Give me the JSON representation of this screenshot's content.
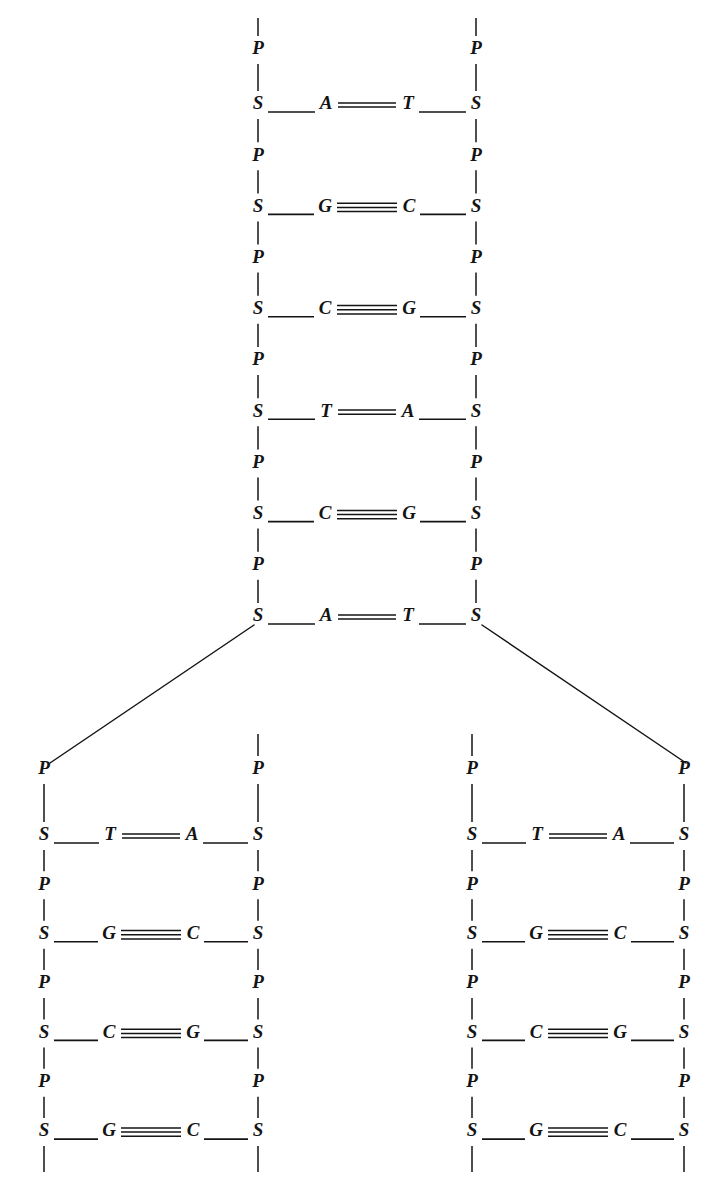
{
  "figure": {
    "background_color": "#ffffff",
    "ink_color": "#141414",
    "width": 727,
    "height": 1194
  },
  "legend_symbols": {
    "phosphate": "P",
    "sugar": "S",
    "adenine": "A",
    "thymine": "T",
    "guanine": "G",
    "cytosine": "C"
  },
  "bond_counts": {
    "A-T": 2,
    "T-A": 2,
    "G-C": 3,
    "C-G": 3
  },
  "parent_duplex": {
    "name": "parent-dna-molecule",
    "left_backbone_x": 258,
    "right_backbone_x": 476,
    "top_phosphate_y": 50,
    "rung_start_y": 105,
    "rung_spacing": 102.4,
    "rungs": [
      {
        "index": 1,
        "left_base": "A",
        "right_base": "T",
        "bonds": 2,
        "left_sugar": "S",
        "right_sugar": "S"
      },
      {
        "index": 2,
        "left_base": "G",
        "right_base": "C",
        "bonds": 3,
        "left_sugar": "S",
        "right_sugar": "S"
      },
      {
        "index": 3,
        "left_base": "C",
        "right_base": "G",
        "bonds": 3,
        "left_sugar": "S",
        "right_sugar": "S"
      },
      {
        "index": 4,
        "left_base": "T",
        "right_base": "A",
        "bonds": 2,
        "left_sugar": "S",
        "right_sugar": "S"
      },
      {
        "index": 5,
        "left_base": "C",
        "right_base": "G",
        "bonds": 3,
        "left_sugar": "S",
        "right_sugar": "S"
      },
      {
        "index": 6,
        "left_base": "A",
        "right_base": "T",
        "bonds": 2,
        "left_sugar": "S",
        "right_sugar": "S"
      }
    ],
    "interleaved_phosphates": [
      "P",
      "P",
      "P",
      "P",
      "P",
      "P",
      "P"
    ]
  },
  "replication_fork": {
    "name": "replication-fork",
    "left_branch": {
      "from_x": 254,
      "from_y": 625,
      "to_x": 50,
      "to_y": 763
    },
    "right_branch": {
      "from_x": 482,
      "from_y": 625,
      "to_x": 686,
      "to_y": 763
    }
  },
  "daughter_duplexes": [
    {
      "name": "left-daughter-dna-molecule",
      "left_backbone_x": 44,
      "right_backbone_x": 258,
      "top_phosphate_y": 770,
      "rung_start_y": 836,
      "rung_spacing": 98.7,
      "outer_strand": "left",
      "rungs": [
        {
          "index": 1,
          "left_base": "T",
          "right_base": "A",
          "bonds": 2,
          "left_sugar": "S",
          "right_sugar": "S"
        },
        {
          "index": 2,
          "left_base": "G",
          "right_base": "C",
          "bonds": 3,
          "left_sugar": "S",
          "right_sugar": "S"
        },
        {
          "index": 3,
          "left_base": "C",
          "right_base": "G",
          "bonds": 3,
          "left_sugar": "S",
          "right_sugar": "S"
        },
        {
          "index": 4,
          "left_base": "G",
          "right_base": "C",
          "bonds": 3,
          "left_sugar": "S",
          "right_sugar": "S"
        }
      ],
      "interleaved_phosphates": [
        "P",
        "P",
        "P",
        "P"
      ]
    },
    {
      "name": "right-daughter-dna-molecule",
      "left_backbone_x": 472,
      "right_backbone_x": 684,
      "top_phosphate_y": 770,
      "rung_start_y": 836,
      "rung_spacing": 98.7,
      "outer_strand": "right",
      "rungs": [
        {
          "index": 1,
          "left_base": "T",
          "right_base": "A",
          "bonds": 2,
          "left_sugar": "S",
          "right_sugar": "S"
        },
        {
          "index": 2,
          "left_base": "G",
          "right_base": "C",
          "bonds": 3,
          "left_sugar": "S",
          "right_sugar": "S"
        },
        {
          "index": 3,
          "left_base": "C",
          "right_base": "G",
          "bonds": 3,
          "left_sugar": "S",
          "right_sugar": "S"
        },
        {
          "index": 4,
          "left_base": "G",
          "right_base": "C",
          "bonds": 3,
          "left_sugar": "S",
          "right_sugar": "S"
        }
      ],
      "interleaved_phosphates": [
        "P",
        "P",
        "P",
        "P"
      ]
    }
  ]
}
